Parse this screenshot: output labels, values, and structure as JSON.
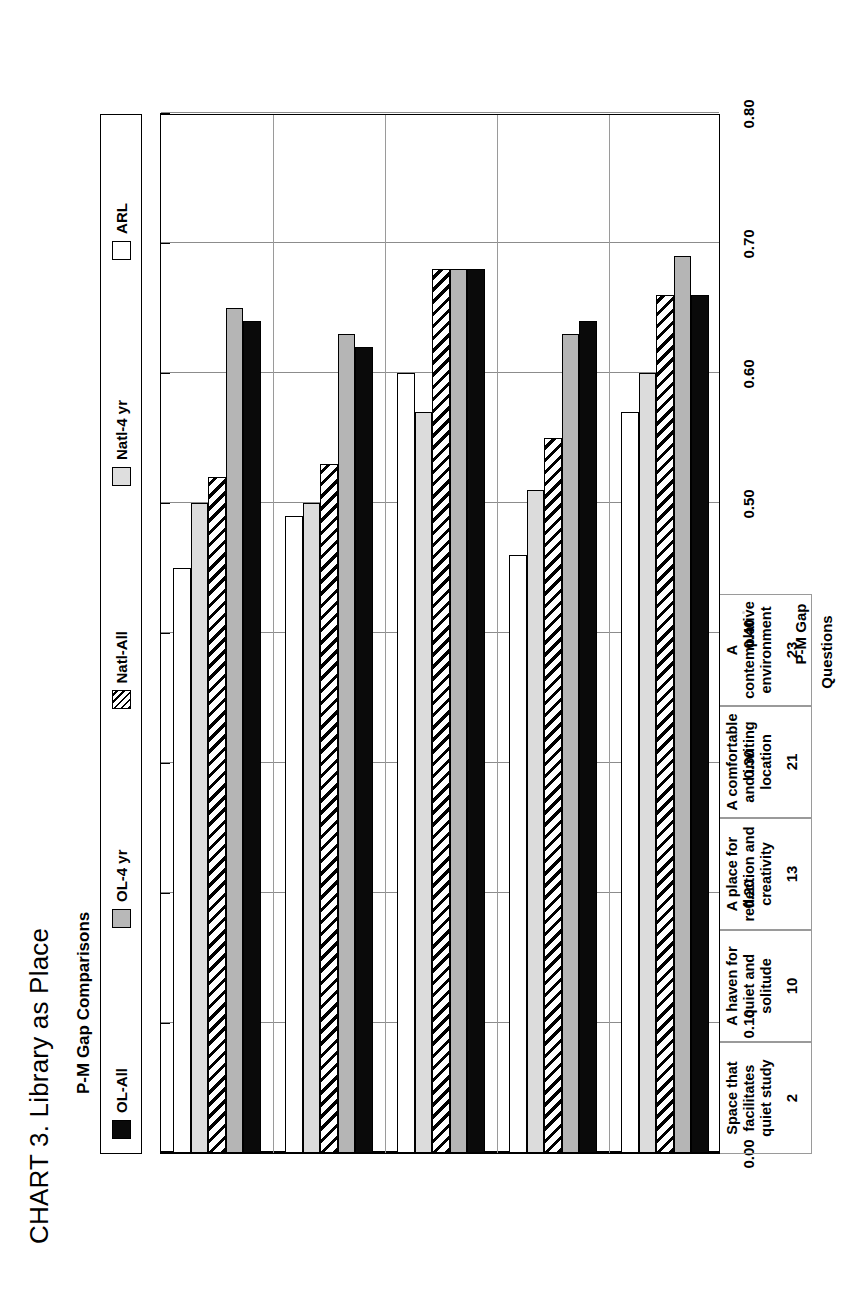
{
  "title": "CHART 3. Library as Place",
  "subtitle": "P-M Gap Comparisons",
  "axes": {
    "xlabel": "Questions",
    "ylabel": "P-M Gap",
    "yticks": [
      "0.00",
      "0.10",
      "0.20",
      "0.30",
      "0.40",
      "0.50",
      "0.60",
      "0.70",
      "0.80"
    ]
  },
  "legend": {
    "items": [
      {
        "label": "OL-All",
        "swatch": "swatch-black",
        "color": "#0a0a0a"
      },
      {
        "label": "OL-4 yr",
        "swatch": "swatch-gray",
        "color": "#b5b5b5"
      },
      {
        "label": "Natl-All",
        "swatch": "swatch-hatch",
        "color": "#ffffff"
      },
      {
        "label": "Natl-4 yr",
        "swatch": "swatch-lgray",
        "color": "#dcdcdc"
      },
      {
        "label": "ARL",
        "swatch": "swatch-white",
        "color": "#ffffff"
      }
    ]
  },
  "chart_data": {
    "type": "bar",
    "orientation": "vertical",
    "title": "CHART 3. Library as Place",
    "subtitle": "P-M Gap Comparisons",
    "xlabel": "Questions",
    "ylabel": "P-M Gap",
    "ylim": [
      0.0,
      0.8
    ],
    "ytick_step": 0.1,
    "grid": true,
    "legend_position": "top",
    "categories": [
      "Space that facilitates quiet study",
      "A haven for quiet and solitude",
      "A place for reflection and creativity",
      "A comfortable and inviting location",
      "A contemplative environment"
    ],
    "category_numbers": [
      "2",
      "10",
      "13",
      "21",
      "23"
    ],
    "series": [
      {
        "name": "OL-All",
        "values": [
          0.64,
          0.62,
          0.68,
          0.64,
          0.66
        ]
      },
      {
        "name": "OL-4 yr",
        "values": [
          0.65,
          0.63,
          0.68,
          0.63,
          0.69
        ]
      },
      {
        "name": "Natl-All",
        "values": [
          0.52,
          0.53,
          0.68,
          0.55,
          0.66
        ]
      },
      {
        "name": "Natl-4 yr",
        "values": [
          0.5,
          0.5,
          0.57,
          0.51,
          0.6
        ]
      },
      {
        "name": "ARL",
        "values": [
          0.45,
          0.49,
          0.6,
          0.46,
          0.57
        ]
      }
    ]
  }
}
